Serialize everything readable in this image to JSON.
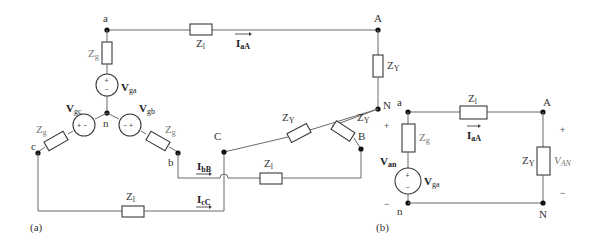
{
  "figure": {
    "panels": [
      {
        "id": "a",
        "caption": "(a)",
        "description": "Three-phase wye-wye circuit",
        "nodes": {
          "a": "a",
          "b": "b",
          "c": "c",
          "n": "n",
          "A": "A",
          "B": "B",
          "C": "C",
          "N": "N"
        },
        "impedances": {
          "source_a": {
            "main": "Z",
            "sub": "g"
          },
          "source_b": {
            "main": "Z",
            "sub": "g"
          },
          "source_c": {
            "main": "Z",
            "sub": "g"
          },
          "line_a": {
            "main": "Z",
            "sub": "l"
          },
          "line_b": {
            "main": "Z",
            "sub": "l"
          },
          "line_c": {
            "main": "Z",
            "sub": "l"
          },
          "load_A": {
            "main": "Z",
            "sub": "Y"
          },
          "load_B": {
            "main": "Z",
            "sub": "Y"
          },
          "load_C": {
            "main": "Z",
            "sub": "Y"
          }
        },
        "sources": {
          "ga": {
            "main": "V",
            "sub": "ga",
            "polarity_top": "+",
            "polarity_bottom": "−"
          },
          "gb": {
            "main": "V",
            "sub": "gb",
            "polarity": "− +"
          },
          "gc": {
            "main": "V",
            "sub": "gc",
            "polarity": "+ −"
          }
        },
        "currents": {
          "aA": {
            "main": "I",
            "sub": "aA"
          },
          "bB": {
            "main": "I",
            "sub": "bB"
          },
          "cC": {
            "main": "I",
            "sub": "cC"
          }
        }
      },
      {
        "id": "b",
        "caption": "(b)",
        "description": "Single-phase equivalent circuit",
        "nodes": {
          "a": "a",
          "n": "n",
          "A": "A",
          "N": "N"
        },
        "impedances": {
          "source": {
            "main": "Z",
            "sub": "g"
          },
          "line": {
            "main": "Z",
            "sub": "l"
          },
          "load": {
            "main": "Z",
            "sub": "Y"
          }
        },
        "sources": {
          "ga": {
            "main": "V",
            "sub": "ga",
            "polarity_top": "+",
            "polarity_bottom": "−"
          }
        },
        "currents": {
          "aA": {
            "main": "I",
            "sub": "aA"
          }
        },
        "voltages": {
          "an": {
            "main": "V",
            "sub": "an",
            "plus": "+",
            "minus": "−"
          },
          "AN": {
            "main": "V",
            "sub": "AN",
            "plus": "+",
            "minus": "−"
          }
        }
      }
    ]
  }
}
